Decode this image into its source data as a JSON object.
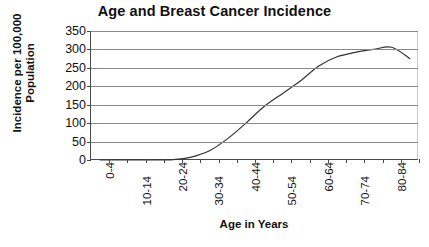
{
  "chart_data": {
    "type": "line",
    "title": "Age and Breast Cancer Incidence",
    "xlabel": "Age in Years",
    "ylabel": "Incidence per 100,000 Population",
    "ylabel_lines": [
      "Incidence per 100,000",
      "Population"
    ],
    "categories": [
      "0-4",
      "5-9",
      "10-14",
      "15-19",
      "20-24",
      "25-29",
      "30-34",
      "35-39",
      "40-44",
      "45-49",
      "50-54",
      "55-59",
      "60-64",
      "65-69",
      "70-74",
      "75-79",
      "80-84",
      "85+"
    ],
    "visible_tick_labels": [
      "0-4",
      "10-14",
      "20-24",
      "30-34",
      "40-44",
      "50-54",
      "60-64",
      "70-74",
      "80-84"
    ],
    "values": [
      0,
      0,
      0,
      0,
      1,
      8,
      25,
      58,
      100,
      145,
      180,
      215,
      255,
      280,
      292,
      300,
      306,
      275
    ],
    "ylim": [
      0,
      350
    ],
    "yticks": [
      0,
      50,
      100,
      150,
      200,
      250,
      300,
      350
    ],
    "ytick_labels": [
      "0",
      "50",
      "100",
      "150",
      "200",
      "250",
      "300",
      "350"
    ],
    "grid": "horizontal",
    "legend": "none",
    "line_color": "#333333",
    "grid_color": "#8a8a8a",
    "axis_color": "#4a4a4a",
    "background": "#ffffff"
  }
}
